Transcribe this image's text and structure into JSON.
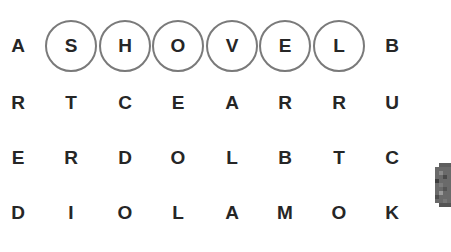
{
  "game": {
    "found_word": "SHOVEL",
    "selection_color": "#7a7a7a",
    "letter_color": "#262626",
    "grid": {
      "rows": [
        [
          "A",
          "S",
          "H",
          "O",
          "V",
          "E",
          "L",
          "B"
        ],
        [
          "R",
          "T",
          "C",
          "E",
          "A",
          "R",
          "R",
          "U"
        ],
        [
          "E",
          "R",
          "D",
          "O",
          "L",
          "B",
          "T",
          "C"
        ],
        [
          "D",
          "I",
          "O",
          "L",
          "A",
          "M",
          "O",
          "K"
        ]
      ],
      "selected_cells": [
        [
          0,
          1
        ],
        [
          0,
          2
        ],
        [
          0,
          3
        ],
        [
          0,
          4
        ],
        [
          0,
          5
        ],
        [
          0,
          6
        ]
      ]
    },
    "side_object": "pixelated-stone-icon"
  }
}
